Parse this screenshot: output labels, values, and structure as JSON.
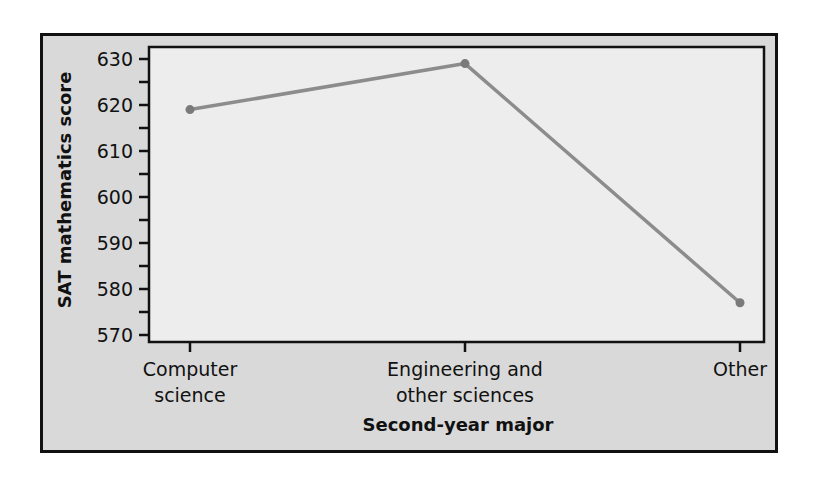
{
  "chart_data": {
    "type": "line",
    "title": "",
    "xlabel": "Second-year major",
    "ylabel": "SAT mathematics score",
    "categories": [
      "Computer science",
      "Engineering and other sciences",
      "Other"
    ],
    "category_lines": [
      [
        "Computer",
        "science"
      ],
      [
        "Engineering and",
        "other sciences"
      ],
      [
        "Other"
      ]
    ],
    "series": [
      {
        "name": "Mean SAT math score",
        "values": [
          619,
          629,
          577
        ]
      }
    ],
    "ylim": [
      570,
      630
    ],
    "yticks": [
      570,
      580,
      590,
      600,
      610,
      620,
      630
    ],
    "y_minor_step": 5,
    "grid": false,
    "legend": null
  },
  "style": {
    "frame_bg": "#d9d9d9",
    "plot_bg": "#ededed",
    "line_color": "#8c8c8c",
    "marker_color": "#7a7a7a",
    "axis_color": "#111111"
  }
}
